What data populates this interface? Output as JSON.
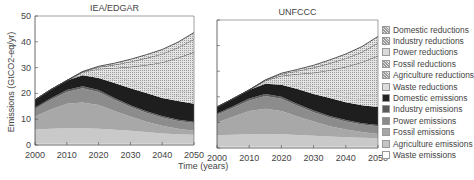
{
  "chart_data": [
    {
      "type": "area",
      "title": "IEA/EDGAR",
      "xlabel": "Time (years)",
      "ylabel": "Emissions (GtCO2-eq/yr)",
      "x": [
        2000,
        2005,
        2010,
        2015,
        2020,
        2025,
        2030,
        2035,
        2040,
        2045,
        2050
      ],
      "ylim": [
        0,
        50
      ],
      "xlim": [
        2000,
        2050
      ],
      "yticks": [
        0,
        10,
        20,
        30,
        40,
        50
      ],
      "xticks": [
        2000,
        2010,
        2020,
        2030,
        2040,
        2050
      ],
      "stacked": true,
      "series": [
        {
          "name": "Waste emissions",
          "values": [
            0.5,
            0.5,
            0.5,
            0.5,
            0.5,
            0.5,
            0.5,
            0.5,
            0.5,
            0.5,
            0.5
          ]
        },
        {
          "name": "Agriculture emissions",
          "values": [
            5.5,
            5.8,
            6.0,
            6.0,
            5.8,
            5.4,
            5.0,
            4.5,
            4.0,
            3.7,
            3.5
          ]
        },
        {
          "name": "Fossil emissions",
          "values": [
            5.0,
            7.5,
            9.5,
            10.0,
            9.2,
            7.3,
            5.5,
            4.0,
            3.0,
            2.1,
            1.5
          ]
        },
        {
          "name": "Power emissions",
          "values": [
            3.0,
            3.7,
            4.5,
            5.5,
            5.0,
            4.3,
            3.8,
            3.5,
            3.2,
            3.0,
            3.0
          ]
        },
        {
          "name": "Industry emissions",
          "values": [
            0.5,
            0.6,
            0.8,
            0.8,
            0.8,
            0.7,
            0.6,
            0.6,
            0.5,
            0.5,
            0.5
          ]
        },
        {
          "name": "Domestic emissions",
          "values": [
            3.0,
            3.4,
            3.7,
            4.2,
            4.7,
            5.8,
            6.6,
            7.0,
            7.0,
            7.2,
            7.0
          ]
        },
        {
          "name": "Waste reductions",
          "values": [
            0,
            0,
            0,
            0.3,
            0.8,
            1.3,
            1.6,
            1.8,
            2.0,
            2.2,
            2.5
          ]
        },
        {
          "name": "Agriculture reductions",
          "values": [
            0,
            0,
            0,
            0.4,
            0.9,
            1.2,
            1.4,
            1.5,
            1.7,
            1.8,
            2.0
          ]
        },
        {
          "name": "Fossil reductions",
          "values": [
            0,
            0,
            0,
            0.5,
            1.8,
            3.4,
            5.3,
            7.6,
            10.1,
            12.8,
            15.5
          ]
        },
        {
          "name": "Power reductions",
          "values": [
            0,
            0,
            0,
            0.2,
            0.7,
            1.2,
            2.0,
            2.7,
            3.3,
            4.0,
            5.0
          ]
        },
        {
          "name": "Industry reductions",
          "values": [
            0,
            0,
            0,
            0.1,
            0.3,
            0.6,
            0.9,
            1.3,
            1.7,
            2.1,
            2.6
          ]
        }
      ]
    },
    {
      "type": "area",
      "title": "UNFCCC",
      "xlabel": "Time (years)",
      "ylabel": "Emissions (GtCO2-eq/yr)",
      "x": [
        2000,
        2005,
        2010,
        2015,
        2020,
        2025,
        2030,
        2035,
        2040,
        2045,
        2050
      ],
      "ylim": [
        0,
        50
      ],
      "xlim": [
        2000,
        2050
      ],
      "yticks": [
        0,
        10,
        20,
        30,
        40,
        50
      ],
      "xticks": [
        2000,
        2010,
        2020,
        2030,
        2040,
        2050
      ],
      "stacked": true,
      "series": [
        {
          "name": "Waste emissions",
          "values": [
            0.5,
            0.5,
            0.5,
            0.5,
            0.5,
            0.5,
            0.5,
            0.5,
            0.5,
            0.5,
            0.5
          ]
        },
        {
          "name": "Agriculture emissions",
          "values": [
            4.5,
            4.7,
            4.9,
            5.0,
            4.9,
            4.6,
            4.3,
            4.0,
            3.7,
            3.5,
            3.3
          ]
        },
        {
          "name": "Fossil emissions",
          "values": [
            5.0,
            7.0,
            9.0,
            9.8,
            9.0,
            7.2,
            5.5,
            4.0,
            3.0,
            2.2,
            1.7
          ]
        },
        {
          "name": "Power emissions",
          "values": [
            3.0,
            3.5,
            4.2,
            5.0,
            4.8,
            4.2,
            3.7,
            3.4,
            3.2,
            3.0,
            3.0
          ]
        },
        {
          "name": "Industry emissions",
          "values": [
            0.5,
            0.6,
            0.7,
            0.8,
            0.8,
            0.7,
            0.6,
            0.6,
            0.5,
            0.5,
            0.5
          ]
        },
        {
          "name": "Domestic emissions",
          "values": [
            2.5,
            3.0,
            3.4,
            4.0,
            4.7,
            5.8,
            6.5,
            7.0,
            7.0,
            7.0,
            7.0
          ]
        },
        {
          "name": "Waste reductions",
          "values": [
            0,
            0,
            0,
            0.3,
            0.8,
            1.3,
            1.6,
            1.8,
            2.0,
            2.2,
            2.5
          ]
        },
        {
          "name": "Agriculture reductions",
          "values": [
            0,
            0,
            0,
            0.4,
            0.9,
            1.2,
            1.4,
            1.5,
            1.7,
            1.8,
            2.0
          ]
        },
        {
          "name": "Fossil reductions",
          "values": [
            0,
            0,
            0,
            0.5,
            1.8,
            3.4,
            5.3,
            7.6,
            10.1,
            12.8,
            15.5
          ]
        },
        {
          "name": "Power reductions",
          "values": [
            0,
            0,
            0,
            0.2,
            0.7,
            1.2,
            2.0,
            2.7,
            3.3,
            4.0,
            5.0
          ]
        },
        {
          "name": "Industry reductions",
          "values": [
            0,
            0,
            0,
            0.1,
            0.3,
            0.6,
            0.9,
            1.3,
            1.7,
            2.1,
            2.6
          ]
        }
      ]
    }
  ],
  "legend": [
    {
      "label": "Domestic reductions",
      "color": "#cfcfcf",
      "hatch": "dots"
    },
    {
      "label": "Industry reductions",
      "color": "#c8c8c8",
      "hatch": "dots"
    },
    {
      "label": "Power reductions",
      "color": "#d9d9d9",
      "hatch": "none"
    },
    {
      "label": "Fossil reductions",
      "color": "#d2d2d2",
      "hatch": "dots"
    },
    {
      "label": "Agriculture reductions",
      "color": "#d6d6d6",
      "hatch": "dots"
    },
    {
      "label": "Waste reductions",
      "color": "#dcdcdc",
      "hatch": "none"
    },
    {
      "label": "Domestic emissions",
      "color": "#222222",
      "hatch": "none"
    },
    {
      "label": "Industry emissions",
      "color": "#5a5a5a",
      "hatch": "none"
    },
    {
      "label": "Power emissions",
      "color": "#8a8a8a",
      "hatch": "none"
    },
    {
      "label": "Fossil emissions",
      "color": "#a6a6a6",
      "hatch": "none"
    },
    {
      "label": "Agriculture emissions",
      "color": "#c4c4c4",
      "hatch": "none"
    },
    {
      "label": "Waste emissions",
      "color": "#ffffff",
      "hatch": "none"
    }
  ],
  "axes": {
    "ylabel": "Emissions (GtCO2-eq/yr)",
    "xlabel": "Time (years)"
  }
}
